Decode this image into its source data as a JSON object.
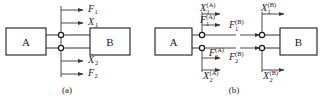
{
  "figure": {
    "width": 322,
    "height": 99,
    "background": "#ffffff",
    "line_color": "#4a4a4a",
    "box_stroke": "#1a1a1a",
    "text_color": "#1a1a1a"
  },
  "panel_a": {
    "caption": "(a)",
    "blocks": [
      {
        "label": "A",
        "name": "block-a"
      },
      {
        "label": "B",
        "name": "block-b"
      }
    ],
    "signals": [
      {
        "name": "signal-f1",
        "base": "F",
        "sub": "1",
        "sup": "",
        "position": "top-outer",
        "direction": "right"
      },
      {
        "name": "signal-x1",
        "base": "X",
        "sub": "1",
        "sup": "",
        "position": "top-inner",
        "direction": "right"
      },
      {
        "name": "signal-x2",
        "base": "X",
        "sub": "2",
        "sup": "",
        "position": "bottom-inner",
        "direction": "right"
      },
      {
        "name": "signal-f2",
        "base": "F",
        "sub": "2",
        "sup": "",
        "position": "bottom-outer",
        "direction": "right"
      }
    ],
    "nodes": [
      {
        "name": "port-node-upper"
      },
      {
        "name": "port-node-lower"
      }
    ]
  },
  "panel_b": {
    "caption": "(b)",
    "blocks": [
      {
        "label": "A",
        "name": "block-a"
      },
      {
        "label": "B",
        "name": "block-b"
      }
    ],
    "signals": [
      {
        "name": "signal-x1-a",
        "base": "X",
        "sub": "1",
        "sup": "(A)",
        "side": "left",
        "position": "upper-top",
        "direction": "right"
      },
      {
        "name": "signal-f1-a",
        "base": "F",
        "sub": "1",
        "sup": "(A)",
        "side": "left",
        "position": "upper-bottom",
        "direction": "right"
      },
      {
        "name": "signal-f2-a",
        "base": "F",
        "sub": "2",
        "sup": "(A)",
        "side": "left",
        "position": "lower-top",
        "direction": "right"
      },
      {
        "name": "signal-x2-a",
        "base": "X",
        "sub": "2",
        "sup": "(A)",
        "side": "left",
        "position": "lower-bottom",
        "direction": "right"
      },
      {
        "name": "signal-x1-b",
        "base": "X",
        "sub": "1",
        "sup": "(B)",
        "side": "right",
        "position": "upper-top",
        "direction": "right"
      },
      {
        "name": "signal-f1-b",
        "base": "F",
        "sub": "1",
        "sup": "(B)",
        "side": "right",
        "position": "upper-bottom",
        "direction": "right"
      },
      {
        "name": "signal-f2-b",
        "base": "F",
        "sub": "2",
        "sup": "(B)",
        "side": "right",
        "position": "lower-top",
        "direction": "right"
      },
      {
        "name": "signal-x2-b",
        "base": "X",
        "sub": "2",
        "sup": "(B)",
        "side": "right",
        "position": "lower-bottom",
        "direction": "right"
      }
    ],
    "nodes": [
      {
        "name": "port-node-a-upper"
      },
      {
        "name": "port-node-a-lower"
      },
      {
        "name": "port-node-b-upper"
      },
      {
        "name": "port-node-b-lower"
      }
    ]
  }
}
